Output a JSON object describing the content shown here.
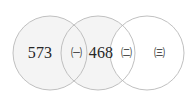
{
  "figure": {
    "type": "venn-diagram",
    "circle_count": 3,
    "canvas": {
      "width": 195,
      "height": 99
    },
    "colors": {
      "fill_shaded": "#f4f4f4",
      "fill_plain": "#ffffff",
      "stroke": "#b9b9b9",
      "text": "#262626",
      "background": "#ffffff"
    }
  },
  "circles": [
    {
      "name": "circle-left",
      "cx": 50,
      "cy": 53,
      "r": 37,
      "shaded": true
    },
    {
      "name": "circle-middle",
      "cx": 98,
      "cy": 53,
      "r": 37,
      "shaded": true
    },
    {
      "name": "circle-right",
      "cx": 147,
      "cy": 53,
      "r": 37,
      "shaded": false
    }
  ],
  "labels": {
    "left_only": {
      "text": "573",
      "x": 40,
      "y": 53,
      "kind": "count"
    },
    "left_middle_overlap": {
      "text": "㈠",
      "x": 76,
      "y": 53,
      "kind": "marker"
    },
    "middle_only": {
      "text": "468",
      "x": 101,
      "y": 53,
      "kind": "count"
    },
    "middle_right_overlap": {
      "text": "㈡",
      "x": 126,
      "y": 53,
      "kind": "marker"
    },
    "right_only": {
      "text": "㈢",
      "x": 159,
      "y": 53,
      "kind": "marker"
    }
  }
}
